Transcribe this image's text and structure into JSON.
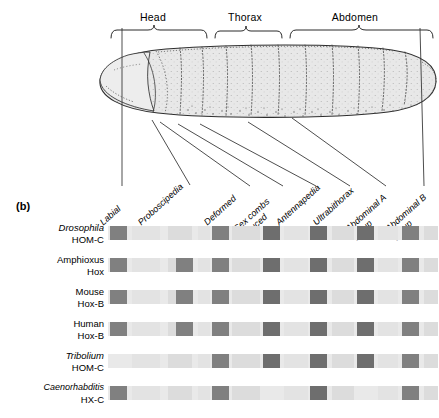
{
  "panel": {
    "tag": "(b)"
  },
  "anatomy": {
    "regions": [
      {
        "name": "head",
        "label": "Head"
      },
      {
        "name": "thorax",
        "label": "Thorax"
      },
      {
        "name": "abdomen",
        "label": "Abdomen"
      }
    ],
    "organism_depicted": "drosophila-larva"
  },
  "genes": [
    {
      "name": "labial",
      "label": "Labial"
    },
    {
      "name": "proboscipedia",
      "label": "Proboscipedia"
    },
    {
      "name": "deformed",
      "label": "Deformed"
    },
    {
      "name": "sex-combs-reduced",
      "label": "Sex combs\nreduced"
    },
    {
      "name": "antennapedia",
      "label": "Antennapedia"
    },
    {
      "name": "ultrabithorax",
      "label": "Ultrabithorax"
    },
    {
      "name": "abdominal-a",
      "label": "Abdominal A\ngroup"
    },
    {
      "name": "abdominal-b",
      "label": "Abdominal B\ngroup"
    }
  ],
  "species_rows": [
    {
      "name": "drosophila",
      "species": "Drosophila",
      "cluster": "HOM-C",
      "italic_species": true,
      "boxes": [
        {
          "x": 2,
          "w": 17,
          "shade": "dark"
        },
        {
          "x": 104,
          "w": 17,
          "shade": "dark"
        },
        {
          "x": 155,
          "w": 17,
          "shade": "darker"
        },
        {
          "x": 202,
          "w": 17,
          "shade": "darker"
        },
        {
          "x": 249,
          "w": 17,
          "shade": "darker"
        },
        {
          "x": 294,
          "w": 17,
          "shade": "dark"
        }
      ]
    },
    {
      "name": "amphioxus",
      "species": "Amphioxus",
      "cluster": "Hox",
      "italic_species": false,
      "boxes": [
        {
          "x": 2,
          "w": 17,
          "shade": "dark"
        },
        {
          "x": 68,
          "w": 17,
          "shade": "dark"
        },
        {
          "x": 104,
          "w": 17,
          "shade": "dark"
        },
        {
          "x": 155,
          "w": 17,
          "shade": "darker"
        },
        {
          "x": 202,
          "w": 17,
          "shade": "darker"
        },
        {
          "x": 249,
          "w": 17,
          "shade": "darker"
        },
        {
          "x": 294,
          "w": 17,
          "shade": "dark"
        }
      ]
    },
    {
      "name": "mouse",
      "species": "Mouse",
      "cluster": "Hox-B",
      "italic_species": false,
      "boxes": [
        {
          "x": 2,
          "w": 17,
          "shade": "dark"
        },
        {
          "x": 68,
          "w": 17,
          "shade": "dark"
        },
        {
          "x": 104,
          "w": 17,
          "shade": "dark"
        },
        {
          "x": 155,
          "w": 17,
          "shade": "darker"
        },
        {
          "x": 202,
          "w": 17,
          "shade": "darker"
        },
        {
          "x": 249,
          "w": 17,
          "shade": "darker"
        },
        {
          "x": 294,
          "w": 17,
          "shade": "dark"
        }
      ]
    },
    {
      "name": "human",
      "species": "Human",
      "cluster": "Hox-B",
      "italic_species": false,
      "boxes": [
        {
          "x": 2,
          "w": 17,
          "shade": "dark"
        },
        {
          "x": 68,
          "w": 17,
          "shade": "dark"
        },
        {
          "x": 104,
          "w": 17,
          "shade": "dark"
        },
        {
          "x": 155,
          "w": 17,
          "shade": "darker"
        },
        {
          "x": 202,
          "w": 17,
          "shade": "darker"
        },
        {
          "x": 249,
          "w": 17,
          "shade": "darker"
        },
        {
          "x": 294,
          "w": 17,
          "shade": "dark"
        }
      ]
    },
    {
      "name": "tribolium",
      "species": "Tribolium",
      "cluster": "HOM-C",
      "italic_species": true,
      "boxes": [
        {
          "x": 104,
          "w": 17,
          "shade": "dark"
        },
        {
          "x": 155,
          "w": 17,
          "shade": "darker"
        },
        {
          "x": 202,
          "w": 17,
          "shade": "darker"
        },
        {
          "x": 249,
          "w": 17,
          "shade": "darker"
        },
        {
          "x": 294,
          "w": 17,
          "shade": "dark"
        }
      ]
    },
    {
      "name": "caenorhabditis",
      "species": "Caenorhabditis",
      "cluster": "HX-C",
      "italic_species": true,
      "boxes": [
        {
          "x": 2,
          "w": 17,
          "shade": "dark"
        },
        {
          "x": 104,
          "w": 17,
          "shade": "dark"
        },
        {
          "x": 202,
          "w": 17,
          "shade": "darker"
        },
        {
          "x": 294,
          "w": 17,
          "shade": "dark"
        }
      ]
    }
  ],
  "colors": {
    "bar_background": "#e9e9e9",
    "box_dark": "#808080",
    "box_darker": "#6e6e6e",
    "outline": "#3a3a3a",
    "body_fill": "#e6e6e6"
  }
}
